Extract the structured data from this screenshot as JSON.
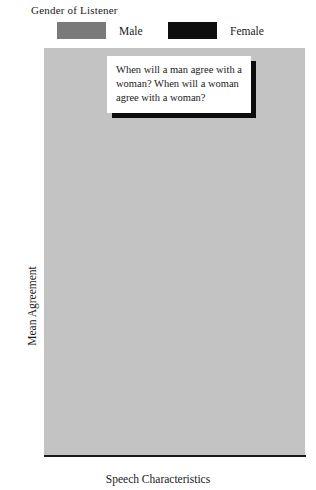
{
  "legend": {
    "title": "Gender of Listener",
    "entries": [
      {
        "label": "Male",
        "color": "#7a7a7a",
        "swatch_name": "legend-swatch-male"
      },
      {
        "label": "Female",
        "color": "#0e0e0e",
        "swatch_name": "legend-swatch-female"
      }
    ]
  },
  "callout": {
    "text": "When will a man agree with a woman?  When will a woman agree with a woman?"
  },
  "axes": {
    "ylabel": "Mean Agreement",
    "xlabel": "Speech Characteristics",
    "yticks": [
      "7",
      "6.5",
      "6",
      "5.5",
      "5",
      "4.5",
      "4",
      "3.5",
      "3",
      "2.5",
      "2"
    ],
    "gridline_values": [
      7,
      6,
      5,
      4,
      3
    ]
  },
  "chart_data": {
    "type": "bar",
    "title": "",
    "xlabel": "Speech Characteristics",
    "ylabel": "Mean Agreement",
    "categories": [
      "Tentative",
      "Assertive"
    ],
    "series": [
      {
        "name": "Male",
        "color": "#7a7a7a",
        "values": [
          5.0,
          3.05
        ]
      },
      {
        "name": "Female",
        "color": "#0e0e0e",
        "values": [
          3.15,
          6.1
        ]
      }
    ],
    "ylim": [
      2,
      7
    ],
    "ytick_step": 0.5,
    "grid": true,
    "gridline_step": 1,
    "legend_position": "top",
    "plot_background": "#c3c3c3",
    "annotations": [
      "When will a man agree with a woman?  When will a woman agree with a woman?"
    ]
  }
}
